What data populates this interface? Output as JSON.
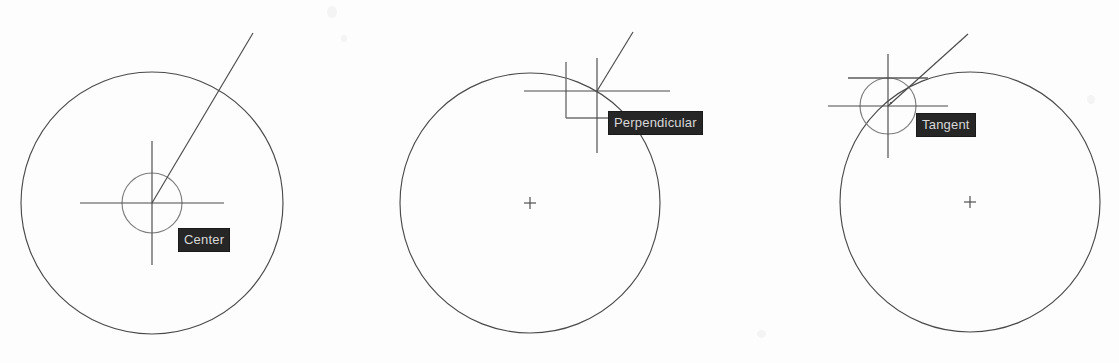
{
  "figure": {
    "background_color": "#fdfdfd",
    "geometry_color": "#4a4a4a",
    "tooltip_background": "#262626",
    "tooltip_text_color": "#d8d8d8",
    "width": 1119,
    "height": 363
  },
  "panels": [
    {
      "id": "center-snap",
      "snap_label": "Center",
      "snap_marker": "center-circle-marker",
      "main_circle": {
        "cx": 152,
        "cy": 203,
        "r": 131
      },
      "center_mark": {
        "cx": 152,
        "cy": 203,
        "type": "crosshair-with-circle"
      },
      "snap_marker_circle": {
        "cx": 152,
        "cy": 203,
        "r": 30
      },
      "crosshair": {
        "cx": 152,
        "cy": 203,
        "half_h": 72,
        "half_v": 62
      },
      "rubber_line": {
        "x1": 152,
        "y1": 203,
        "x2": 253,
        "y2": 33
      },
      "tooltip": {
        "x": 178,
        "y": 228,
        "width": 62,
        "height": 21
      }
    },
    {
      "id": "perpendicular-snap",
      "snap_label": "Perpendicular",
      "snap_marker": "perpendicular-angle-marker",
      "main_circle": {
        "cx": 530,
        "cy": 203,
        "r": 130
      },
      "center_mark": {
        "cx": 530,
        "cy": 203,
        "type": "small-plus"
      },
      "snap_marker_box": {
        "x": 565,
        "y": 62,
        "size": 56
      },
      "crosshair": {
        "cx": 597,
        "cy": 91,
        "half_h": 73,
        "half_v": 62
      },
      "rubber_line": {
        "x1": 597,
        "y1": 91,
        "x2": 633,
        "y2": 32
      },
      "tooltip": {
        "x": 608,
        "y": 111,
        "width": 109,
        "height": 21
      }
    },
    {
      "id": "tangent-snap",
      "snap_label": "Tangent",
      "snap_marker": "tangent-circle-marker",
      "main_circle": {
        "cx": 970,
        "cy": 202,
        "r": 130
      },
      "center_mark": {
        "cx": 970,
        "cy": 202,
        "type": "small-plus"
      },
      "snap_marker_circle": {
        "cx": 888,
        "cy": 106,
        "r": 28
      },
      "snap_marker_tangent_line": {
        "x1": 848,
        "y1": 78,
        "x2": 928,
        "y2": 78
      },
      "crosshair": {
        "cx": 888,
        "cy": 106,
        "half_h": 60,
        "half_v": 52
      },
      "rubber_line": {
        "x1": 888,
        "y1": 106,
        "x2": 968,
        "y2": 34
      },
      "tooltip": {
        "x": 916,
        "y": 113,
        "width": 73,
        "height": 21
      }
    }
  ]
}
